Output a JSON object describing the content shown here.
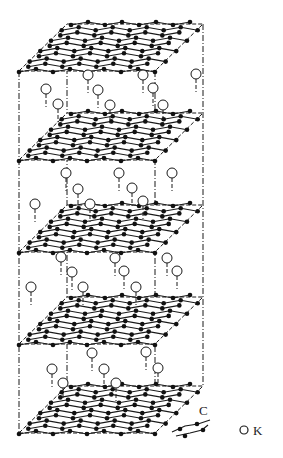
{
  "figure": {
    "colors": {
      "line": "#1a1a1a",
      "atom_c": "#111111",
      "atom_k_fill": "#ffffff",
      "background": "#ffffff"
    }
  },
  "geometry": {
    "left_x": 19,
    "right_x": 155,
    "offset_x": 48,
    "depth_y": 47,
    "layer_front_y": [
      71,
      160,
      252,
      344,
      433
    ],
    "box_right_back_x": 203
  },
  "k_atoms": [
    {
      "layer_gap": 0,
      "points": [
        [
          88,
          75
        ],
        [
          143,
          75
        ],
        [
          196,
          74
        ],
        [
          46,
          89
        ],
        [
          98,
          90
        ],
        [
          153,
          88
        ],
        [
          58,
          104
        ],
        [
          110,
          105
        ],
        [
          163,
          105
        ]
      ]
    },
    {
      "layer_gap": 1,
      "points": [
        [
          66,
          173
        ],
        [
          119,
          173
        ],
        [
          172,
          173
        ],
        [
          78,
          189
        ],
        [
          132,
          188
        ],
        [
          35,
          204
        ],
        [
          90,
          204
        ],
        [
          143,
          201
        ]
      ]
    },
    {
      "layer_gap": 2,
      "points": [
        [
          61,
          257
        ],
        [
          115,
          258
        ],
        [
          167,
          258
        ],
        [
          72,
          272
        ],
        [
          124,
          271
        ],
        [
          177,
          271
        ],
        [
          31,
          287
        ],
        [
          83,
          287
        ],
        [
          136,
          287
        ]
      ]
    },
    {
      "layer_gap": 3,
      "points": [
        [
          92,
          353
        ],
        [
          146,
          352
        ],
        [
          52,
          369
        ],
        [
          104,
          369
        ],
        [
          158,
          368
        ],
        [
          63,
          383
        ],
        [
          116,
          383
        ]
      ]
    }
  ],
  "legend": {
    "carbon_label": "C",
    "potassium_label": "K"
  }
}
